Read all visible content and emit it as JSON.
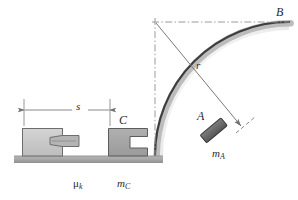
{
  "figure": {
    "background_color": "#ffffff"
  },
  "labels": {
    "point_b": "B",
    "point_a": "A",
    "radius": "r",
    "block_c": "C",
    "distance_s": "s",
    "mass_a_base": "m",
    "mass_a_sub": "A",
    "friction_base": "μ",
    "friction_sub": "k",
    "mass_c_base": "m",
    "mass_c_sub": "C"
  },
  "colors": {
    "ground": "#a8a8a8",
    "ground_edge": "#8e8e8e",
    "block_left_fill": "#c9c9c9",
    "block_left_edge": "#6e6e6e",
    "plunger_fill": "#b0b0b0",
    "plunger_edge": "#6e6e6e",
    "block_c_fill": "#a5a5a5",
    "block_c_edge": "#5d5d5d",
    "block_a_fill": "#6d6d6d",
    "block_a_edge": "#3a3a3a",
    "arc_stroke": "#3d3d3d",
    "arc_shadow": "#b9b9b9",
    "centerline": "#9a9a9a",
    "dimension_line": "#7a7a7a",
    "radius_line": "#7a7a7a",
    "text": "#2b2b2b"
  },
  "geometry": {
    "ground_y": 156,
    "ground_left": 14,
    "ground_right": 163,
    "ground_thickness": 7,
    "arc_center_x": 155,
    "arc_center_y": 22,
    "arc_radius": 134,
    "point_b_x": 289,
    "point_b_y": 22,
    "block_a_angle_deg": 50,
    "dimension_left_x": 24,
    "dimension_right_x": 110,
    "dimension_y": 110
  },
  "elements": {
    "ground_name": "ground-surface",
    "arc_name": "circular-ramp-arc",
    "centerline_vertical_name": "vertical-centerline",
    "centerline_horizontal_name": "horizontal-centerline",
    "radius_arrow_name": "radius-arrow",
    "dimension_name": "distance-dimension-line"
  }
}
